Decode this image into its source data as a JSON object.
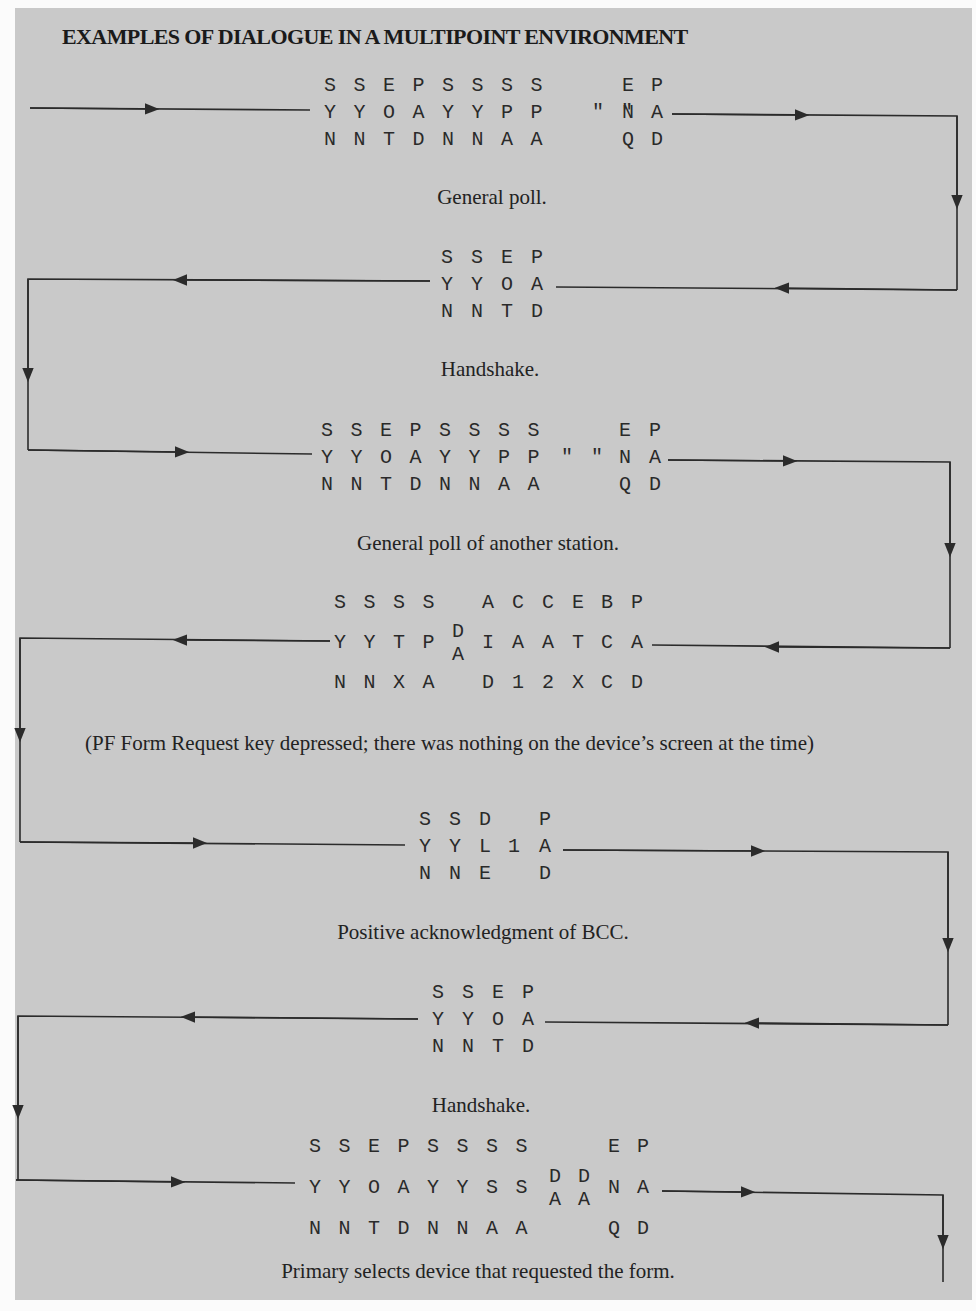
{
  "title": "EXAMPLES OF DIALOGUE IN A MULTIPOINT ENVIRONMENT",
  "colors": {
    "background": "#fbfbfb",
    "panel": "#c9c9c9",
    "ink": "#2a2a2a"
  },
  "frames": [
    {
      "id": "general-poll",
      "direction": "right",
      "columns": [
        [
          "S",
          "Y",
          "N"
        ],
        [
          "S",
          "Y",
          "N"
        ],
        [
          "E",
          "O",
          "T"
        ],
        [
          "P",
          "A",
          "D"
        ],
        [
          "S",
          "Y",
          "N"
        ],
        [
          "S",
          "Y",
          "N"
        ],
        [
          "S",
          "P",
          "A"
        ],
        [
          "S",
          "P",
          "A"
        ],
        [
          "",
          "\"",
          ""
        ],
        [
          "",
          "\"",
          ""
        ],
        [
          "E",
          "N",
          "Q"
        ],
        [
          "P",
          "A",
          "D"
        ]
      ],
      "caption": "General poll."
    },
    {
      "id": "handshake-1",
      "direction": "left",
      "columns": [
        [
          "S",
          "Y",
          "N"
        ],
        [
          "S",
          "Y",
          "N"
        ],
        [
          "E",
          "O",
          "T"
        ],
        [
          "P",
          "A",
          "D"
        ]
      ],
      "caption": "Handshake."
    },
    {
      "id": "general-poll-another",
      "direction": "right",
      "columns": [
        [
          "S",
          "Y",
          "N"
        ],
        [
          "S",
          "Y",
          "N"
        ],
        [
          "E",
          "O",
          "T"
        ],
        [
          "P",
          "A",
          "D"
        ],
        [
          "S",
          "Y",
          "N"
        ],
        [
          "S",
          "Y",
          "N"
        ],
        [
          "S",
          "P",
          "A"
        ],
        [
          "S",
          "P",
          "A"
        ],
        [
          "",
          "\"",
          ""
        ],
        [
          "",
          "\"",
          ""
        ],
        [
          "E",
          "N",
          "Q"
        ],
        [
          "P",
          "A",
          "D"
        ]
      ],
      "caption": "General poll of another station."
    },
    {
      "id": "form-request",
      "direction": "left",
      "columns": [
        [
          "S",
          "Y",
          "N"
        ],
        [
          "S",
          "Y",
          "N"
        ],
        [
          "S",
          "T",
          "X"
        ],
        [
          "S",
          "P",
          "A"
        ],
        [
          "",
          "D/A",
          ""
        ],
        [
          "A",
          "I",
          "D"
        ],
        [
          "C",
          "A",
          "1"
        ],
        [
          "C",
          "A",
          "2"
        ],
        [
          "E",
          "T",
          "X"
        ],
        [
          "B",
          "C",
          "C"
        ],
        [
          "P",
          "A",
          "D"
        ]
      ],
      "caption": "(PF Form Request key depressed; there was nothing on the device’s screen at the time)"
    },
    {
      "id": "positive-ack",
      "direction": "right",
      "columns": [
        [
          "S",
          "Y",
          "N"
        ],
        [
          "S",
          "Y",
          "N"
        ],
        [
          "D",
          "L",
          "E"
        ],
        [
          "",
          "1",
          ""
        ],
        [
          "P",
          "A",
          "D"
        ]
      ],
      "caption": "Positive acknowledgment of BCC."
    },
    {
      "id": "handshake-2",
      "direction": "left",
      "columns": [
        [
          "S",
          "Y",
          "N"
        ],
        [
          "S",
          "Y",
          "N"
        ],
        [
          "E",
          "O",
          "T"
        ],
        [
          "P",
          "A",
          "D"
        ]
      ],
      "caption": "Handshake."
    },
    {
      "id": "primary-selects",
      "direction": "right",
      "columns": [
        [
          "S",
          "Y",
          "N"
        ],
        [
          "S",
          "Y",
          "N"
        ],
        [
          "E",
          "O",
          "T"
        ],
        [
          "P",
          "A",
          "D"
        ],
        [
          "S",
          "Y",
          "N"
        ],
        [
          "S",
          "Y",
          "N"
        ],
        [
          "S",
          "S",
          "A"
        ],
        [
          "S",
          "S",
          "A"
        ],
        [
          "",
          "D/A",
          ""
        ],
        [
          "",
          "D/A",
          ""
        ],
        [
          "E",
          "N",
          "Q"
        ],
        [
          "P",
          "A",
          "D"
        ]
      ],
      "caption": "Primary selects device that requested the form."
    }
  ]
}
